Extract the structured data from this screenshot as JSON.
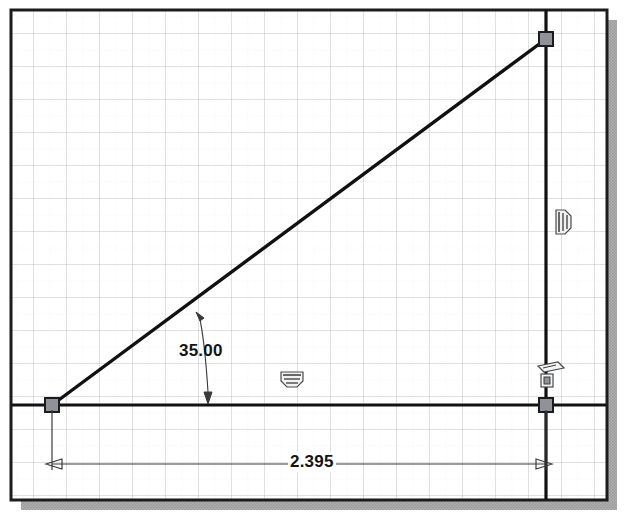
{
  "app": {
    "kind": "cad-sketch-viewport",
    "background_color": "#ffffff",
    "frame_color": "#1c1c1c",
    "shadow_color": "#a8a8a8",
    "geometry_color": "#111111",
    "grid_major_color": "#b9bdc4",
    "grid_minor_color": "#dfe2e6",
    "point_fill_color": "#8f9298",
    "dimension_color": "#2b2b2b"
  },
  "viewport": {
    "frame": {
      "x": 11,
      "y": 10,
      "width": 596,
      "height": 490
    },
    "shadow_offset": 10,
    "grid": {
      "major_spacing": 33,
      "minor_spacing": 16.5,
      "visible": true
    }
  },
  "sketch": {
    "name": "right-triangle-sketch",
    "entities": [
      {
        "id": "line-horizontal",
        "type": "line",
        "name": "horizontal-base-line",
        "x1": 11,
        "y1": 405,
        "x2": 607,
        "y2": 405
      },
      {
        "id": "line-inclined",
        "type": "line",
        "name": "inclined-hypotenuse-line",
        "x1": 52,
        "y1": 405,
        "x2": 546,
        "y2": 39
      },
      {
        "id": "line-vertical",
        "type": "line",
        "name": "vertical-right-line",
        "x1": 546,
        "y1": 10,
        "x2": 546,
        "y2": 500
      }
    ],
    "points": [
      {
        "id": "point-origin",
        "name": "origin-endpoint",
        "x": 52,
        "y": 405
      },
      {
        "id": "point-apex",
        "name": "apex-endpoint",
        "x": 546,
        "y": 39
      },
      {
        "id": "point-corner",
        "name": "corner-endpoint",
        "x": 546,
        "y": 405
      }
    ],
    "constraints": [
      {
        "id": "constraint-horizontal",
        "name": "horizontal-constraint-icon",
        "glyph": "horizontal-constraint",
        "x": 292,
        "y": 379
      },
      {
        "id": "constraint-vertical",
        "name": "vertical-constraint-icon",
        "glyph": "vertical-constraint",
        "x": 561,
        "y": 222
      },
      {
        "id": "constraint-coincident",
        "name": "coincident-constraint-icon",
        "glyph": "coincident-constraint",
        "x": 547,
        "y": 379
      }
    ]
  },
  "dimensions": {
    "angular": {
      "name": "angle-dimension",
      "value": "35.00",
      "unit": "degrees",
      "arrow_top": {
        "x": 196,
        "y": 312
      },
      "arrow_bottom": {
        "x": 208,
        "y": 402
      },
      "label_x": 179,
      "label_y": 341
    },
    "linear": {
      "name": "length-dimension",
      "value": "2.395",
      "unit": "inches",
      "line_y": 464,
      "extent_left": 52,
      "extent_right": 546,
      "label_x": 288,
      "label_y": 452
    }
  }
}
